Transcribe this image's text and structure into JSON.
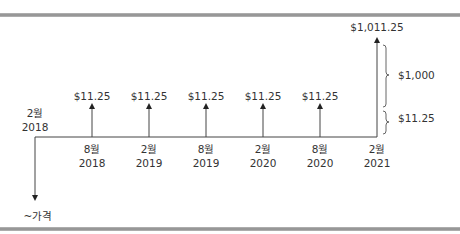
{
  "diagram": {
    "type": "cash-flow-timeline",
    "start": {
      "month": "2월",
      "year": "2018"
    },
    "initial_outflow_label": "~가격",
    "periods": [
      {
        "month": "8월",
        "year": "2018",
        "cash_flow": "$11.25"
      },
      {
        "month": "2월",
        "year": "2019",
        "cash_flow": "$11.25"
      },
      {
        "month": "8월",
        "year": "2019",
        "cash_flow": "$11.25"
      },
      {
        "month": "2월",
        "year": "2020",
        "cash_flow": "$11.25"
      },
      {
        "month": "8월",
        "year": "2020",
        "cash_flow": "$11.25"
      },
      {
        "month": "2월",
        "year": "2021",
        "cash_flow": "$1,011.25"
      }
    ],
    "final_breakdown": {
      "principal_label": "$1,000",
      "coupon_label": "$11.25"
    }
  },
  "colors": {
    "line": "#333333",
    "rule": "#9a9a9a"
  }
}
